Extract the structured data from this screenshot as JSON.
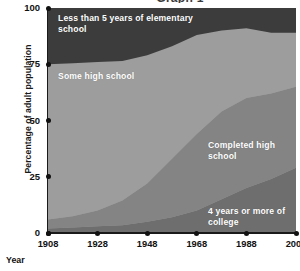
{
  "chart_data": {
    "type": "area",
    "title": "Graph 1",
    "xlabel": "Year",
    "ylabel": "Percentage of adult population",
    "xlim": [
      1908,
      2008
    ],
    "ylim": [
      0,
      100
    ],
    "xticks": [
      "1908",
      "1928",
      "1948",
      "1968",
      "1988",
      "2008"
    ],
    "yticks": [
      "0",
      "25",
      "50",
      "75",
      "100"
    ],
    "grid": false,
    "legend_position": "inline-band-labels",
    "stacked": true,
    "stack_order": "bottom-to-top",
    "x": [
      1908,
      1918,
      1928,
      1938,
      1948,
      1958,
      1968,
      1978,
      1988,
      1998,
      2008
    ],
    "series": [
      {
        "name": "4 years or more of college",
        "label": "4 years or more of college",
        "color": "#6e6e6e",
        "values": [
          2,
          2.5,
          3,
          3.5,
          5,
          7,
          10,
          15,
          20,
          24,
          29
        ]
      },
      {
        "name": "Completed high school",
        "label": "Completed high school",
        "color": "#848484",
        "values": [
          4,
          5,
          7,
          11,
          17,
          26,
          34,
          39,
          40,
          38,
          36
        ]
      },
      {
        "name": "Some high school",
        "label": "Some high school",
        "color": "#9d9d9d",
        "values": [
          69,
          68,
          66,
          62,
          57,
          50,
          44,
          36,
          31,
          27,
          24
        ]
      },
      {
        "name": "Less than 5 years of elementary school",
        "label": "Less than 5 years of elementary school",
        "color": "#3c3c3c",
        "values": [
          25,
          24.5,
          24,
          23.5,
          21,
          17,
          12,
          10,
          9,
          11,
          11
        ]
      }
    ]
  },
  "axis": {
    "y_title": "Percentage of adult population",
    "x_title": "Year"
  },
  "colors": {
    "elementary": "#3c3c3c",
    "some_high_school": "#9d9d9d",
    "completed_high_school": "#848484",
    "college": "#6e6e6e",
    "axis": "#111111",
    "background": "#ffffff"
  }
}
